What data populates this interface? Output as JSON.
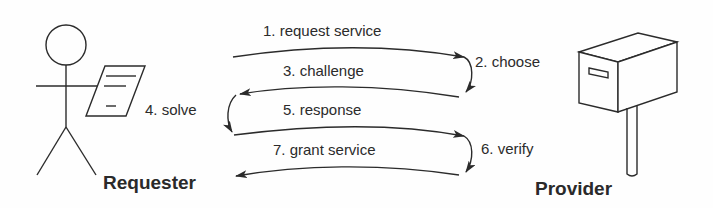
{
  "diagram": {
    "type": "sequence / challenge-response protocol",
    "actors": {
      "requester": {
        "label": "Requester",
        "icon": "stick-figure-with-document-icon"
      },
      "provider": {
        "label": "Provider",
        "icon": "mailbox-icon"
      }
    },
    "steps": [
      {
        "id": 1,
        "label": "1. request service",
        "from": "Requester",
        "to": "Provider"
      },
      {
        "id": 2,
        "label": "2. choose",
        "at": "Provider"
      },
      {
        "id": 3,
        "label": "3. challenge",
        "from": "Provider",
        "to": "Requester"
      },
      {
        "id": 4,
        "label": "4. solve",
        "at": "Requester"
      },
      {
        "id": 5,
        "label": "5. response",
        "from": "Requester",
        "to": "Provider"
      },
      {
        "id": 6,
        "label": "6. verify",
        "at": "Provider"
      },
      {
        "id": 7,
        "label": "7. grant service",
        "from": "Provider",
        "to": "Requester"
      }
    ],
    "colors": {
      "stroke": "#2b2b2b",
      "background": "#fefefe"
    }
  }
}
